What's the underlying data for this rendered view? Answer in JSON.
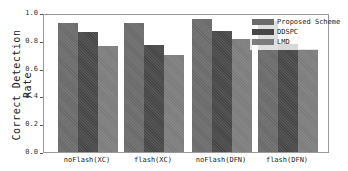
{
  "chart_data": {
    "type": "bar",
    "title": "",
    "xlabel": "",
    "ylabel": "Correct Detection Rate",
    "ylim": [
      0,
      1.0
    ],
    "yticks": [
      "0.0",
      "0.2",
      "0.4",
      "0.6",
      "0.8",
      "1.0"
    ],
    "categories": [
      "noFlash(XC)",
      "flash(XC)",
      "noFlash(DFN)",
      "flash(DFN)"
    ],
    "series": [
      {
        "name": "Proposed Scheme",
        "color": "#6a6a6a",
        "values": [
          0.93,
          0.93,
          0.96,
          0.94
        ]
      },
      {
        "name": "DDSPC",
        "color": "#474747",
        "values": [
          0.86,
          0.77,
          0.87,
          0.78
        ]
      },
      {
        "name": "LMD",
        "color": "#7c7c7c",
        "values": [
          0.76,
          0.7,
          0.81,
          0.74
        ]
      }
    ],
    "legend_position": "upper right",
    "grid": false
  }
}
